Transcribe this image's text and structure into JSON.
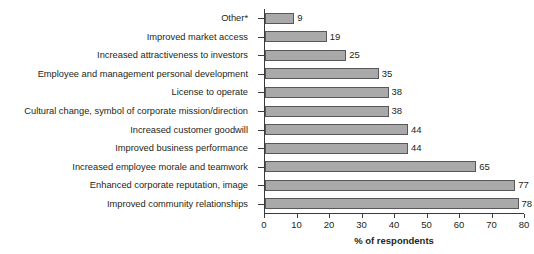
{
  "chart_data": {
    "type": "bar",
    "orientation": "horizontal",
    "title": "",
    "xlabel": "% of respondents",
    "ylabel": "",
    "xlim": [
      0,
      80
    ],
    "xticks": [
      0,
      10,
      20,
      30,
      40,
      50,
      60,
      70,
      80
    ],
    "grid": false,
    "legend": null,
    "categories": [
      "Other*",
      "Improved market access",
      "Increased attractiveness to investors",
      "Employee and management personal development",
      "License to operate",
      "Cultural change, symbol of corporate mission/direction",
      "Increased customer goodwill",
      "Improved business performance",
      "Increased employee morale and teamwork",
      "Enhanced corporate reputation, image",
      "Improved community relationships"
    ],
    "values": [
      9,
      19,
      25,
      35,
      38,
      38,
      44,
      44,
      65,
      77,
      78
    ],
    "value_labels": [
      "9",
      "19",
      "25",
      "35",
      "38",
      "38",
      "44",
      "44",
      "65",
      "77",
      "78"
    ],
    "bar_fill_color": "#a9a9a9",
    "bar_border_color": "#58585a",
    "axis_color": "#3a3a3a",
    "text_color": "#231f20"
  }
}
